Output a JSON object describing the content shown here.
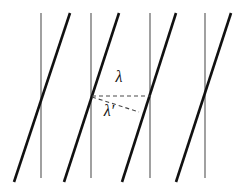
{
  "figure": {
    "name": "wavelength-scattering-diagram",
    "width": 244,
    "height": 190,
    "background_color": "#ffffff",
    "vertical_lines": {
      "name": "lattice-plane-lines",
      "color": "#6e6e6e",
      "stroke_width": 1.3,
      "y_top": 13,
      "y_bottom": 178,
      "x_positions": [
        41,
        91,
        150,
        205
      ]
    },
    "diagonal_lines": {
      "name": "wavefront-lines",
      "color": "#111111",
      "stroke_width": 2.6,
      "y_top": 13,
      "y_bottom": 182,
      "x_top": [
        70,
        119,
        176,
        231
      ],
      "x_bottom": [
        14,
        64,
        122,
        176
      ]
    },
    "dashed_annotations": {
      "color": "#4a4a4a",
      "stroke_width": 1.1,
      "dash_pattern": "4 3",
      "incident": {
        "name": "lambda-dashed-line",
        "orientation": "horizontal",
        "x1": 92,
        "y1": 96,
        "x2": 151,
        "y2": 96
      },
      "scattered": {
        "name": "lambda-prime-dashed-line",
        "orientation": "slanted-down-right",
        "x1": 92,
        "y1": 97,
        "x2": 139,
        "y2": 112
      }
    },
    "labels": [
      {
        "name": "lambda-label",
        "text": "λ",
        "x": 119,
        "y": 82,
        "font_size": 16,
        "color": "#111111"
      },
      {
        "name": "lambda-prime-label",
        "text": "λ′",
        "x": 109,
        "y": 116,
        "font_size": 16,
        "color": "#111111"
      }
    ]
  }
}
